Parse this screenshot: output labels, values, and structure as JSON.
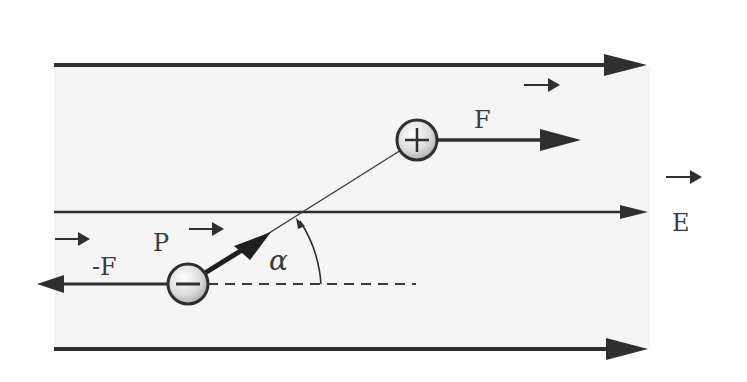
{
  "diagram": {
    "field": {
      "label": "E",
      "vector_arrow": "→",
      "lines": 3
    },
    "positive_charge": {
      "symbol": "+",
      "force_label": "F",
      "force_vector_arrow": "→"
    },
    "negative_charge": {
      "symbol": "−",
      "force_label": "-F",
      "force_vector_arrow": "→"
    },
    "dipole_moment": {
      "label": "P",
      "vector_arrow": "→"
    },
    "angle": {
      "label": "α"
    },
    "colors": {
      "line": "#2f2f2f",
      "band": "#f4f4f4",
      "label": "#3a3a3a"
    }
  }
}
